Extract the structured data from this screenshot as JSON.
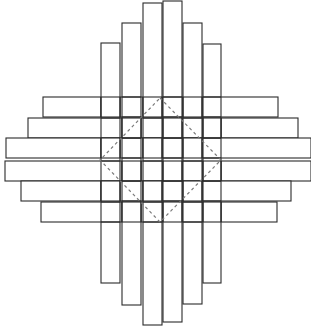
{
  "diagram": {
    "title": "",
    "stroke_color": "#2a2a2a",
    "fill_color": "#ffffff",
    "dash_color": "#7a7a7a",
    "vertical_strips": [
      {
        "x": 101,
        "w": 19,
        "top": 43,
        "bottom": 283
      },
      {
        "x": 122,
        "w": 19,
        "top": 23,
        "bottom": 305
      },
      {
        "x": 143,
        "w": 19,
        "top": 3,
        "bottom": 325
      },
      {
        "x": 163,
        "w": 19,
        "top": 1,
        "bottom": 322
      },
      {
        "x": 183,
        "w": 19,
        "top": 23,
        "bottom": 304
      },
      {
        "x": 203,
        "w": 18,
        "top": 44,
        "bottom": 283
      }
    ],
    "horizontal_strips": [
      {
        "y": 97,
        "h": 20,
        "left": 43,
        "right": 278
      },
      {
        "y": 118,
        "h": 20,
        "left": 28,
        "right": 298
      },
      {
        "y": 138,
        "h": 20,
        "left": 6,
        "right": 311
      },
      {
        "y": 161,
        "h": 20,
        "left": 5,
        "right": 311
      },
      {
        "y": 181,
        "h": 20,
        "left": 21,
        "right": 291
      },
      {
        "y": 202,
        "h": 20,
        "left": 41,
        "right": 277
      }
    ],
    "dashed_diamond": {
      "top": [
        160,
        98
      ],
      "right": [
        221,
        160
      ],
      "bottom": [
        160,
        222
      ],
      "left": [
        100,
        160
      ]
    }
  }
}
